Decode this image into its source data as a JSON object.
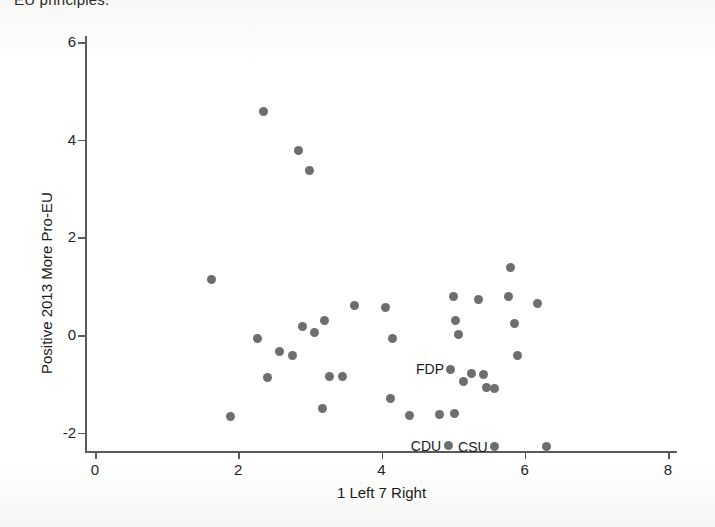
{
  "figure": {
    "caption_sliver": "EU principles.",
    "marker_color": "#6e6e6e",
    "axis_color": "#5a5a5a",
    "background": "#ffffff"
  },
  "chart_data": {
    "type": "scatter",
    "title": "",
    "xlabel": "1 Left 7 Right",
    "ylabel": "Positive 2013 More Pro-EU",
    "xlim": [
      0,
      8
    ],
    "ylim": [
      -2.6,
      6.4
    ],
    "xticks": [
      0,
      2,
      4,
      6,
      8
    ],
    "xticklabels": [
      "0",
      "2",
      "4",
      "6",
      "8"
    ],
    "yticks": [
      -2,
      0,
      2,
      4,
      6
    ],
    "yticklabels": [
      "-2",
      "0",
      "2",
      "4",
      "6"
    ],
    "grid": false,
    "legend": "none",
    "points": [
      {
        "x": 1.63,
        "y": 1.13,
        "label": ""
      },
      {
        "x": 1.89,
        "y": -1.66,
        "label": ""
      },
      {
        "x": 2.27,
        "y": -0.07,
        "label": ""
      },
      {
        "x": 2.35,
        "y": 4.58,
        "label": ""
      },
      {
        "x": 2.41,
        "y": -0.88,
        "label": ""
      },
      {
        "x": 2.58,
        "y": -0.33,
        "label": ""
      },
      {
        "x": 2.76,
        "y": -0.42,
        "label": ""
      },
      {
        "x": 2.84,
        "y": 3.78,
        "label": ""
      },
      {
        "x": 2.9,
        "y": 0.17,
        "label": ""
      },
      {
        "x": 3.0,
        "y": 3.37,
        "label": ""
      },
      {
        "x": 3.06,
        "y": 0.06,
        "label": ""
      },
      {
        "x": 3.2,
        "y": 0.29,
        "label": ""
      },
      {
        "x": 3.28,
        "y": -0.84,
        "label": ""
      },
      {
        "x": 3.18,
        "y": -1.5,
        "label": ""
      },
      {
        "x": 3.45,
        "y": -0.84,
        "label": ""
      },
      {
        "x": 3.63,
        "y": 0.61,
        "label": ""
      },
      {
        "x": 4.05,
        "y": 0.56,
        "label": ""
      },
      {
        "x": 4.16,
        "y": -0.07,
        "label": ""
      },
      {
        "x": 4.12,
        "y": -1.3,
        "label": ""
      },
      {
        "x": 4.39,
        "y": -1.65,
        "label": ""
      },
      {
        "x": 5.0,
        "y": 0.78,
        "label": ""
      },
      {
        "x": 5.04,
        "y": 0.3,
        "label": ""
      },
      {
        "x": 5.08,
        "y": 0.02,
        "label": ""
      },
      {
        "x": 4.97,
        "y": -0.7,
        "label": "FDP"
      },
      {
        "x": 5.14,
        "y": -0.95,
        "label": ""
      },
      {
        "x": 5.25,
        "y": -0.78,
        "label": ""
      },
      {
        "x": 5.35,
        "y": 0.72,
        "label": ""
      },
      {
        "x": 5.43,
        "y": -0.8,
        "label": ""
      },
      {
        "x": 5.02,
        "y": -1.6,
        "label": ""
      },
      {
        "x": 4.81,
        "y": -1.63,
        "label": ""
      },
      {
        "x": 4.93,
        "y": -2.27,
        "label": "CDU"
      },
      {
        "x": 5.46,
        "y": -1.08,
        "label": ""
      },
      {
        "x": 5.58,
        "y": -1.1,
        "label": ""
      },
      {
        "x": 5.58,
        "y": -2.29,
        "label": "CSU"
      },
      {
        "x": 5.8,
        "y": 1.39,
        "label": ""
      },
      {
        "x": 5.77,
        "y": 0.78,
        "label": ""
      },
      {
        "x": 5.85,
        "y": 0.23,
        "label": ""
      },
      {
        "x": 5.9,
        "y": -0.41,
        "label": ""
      },
      {
        "x": 6.18,
        "y": 0.65,
        "label": ""
      },
      {
        "x": 6.3,
        "y": -2.29,
        "label": ""
      }
    ]
  }
}
